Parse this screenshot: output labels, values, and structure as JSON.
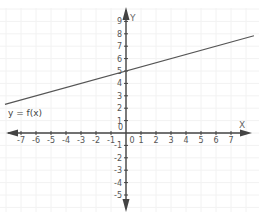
{
  "chart_data": {
    "type": "line",
    "title": "",
    "xlabel": "X",
    "ylabel": "Y",
    "function_label": "y = f(x)",
    "xlim": [
      -8,
      8.5
    ],
    "ylim": [
      -6,
      10
    ],
    "grid": true,
    "x_ticks": [
      -7,
      -6,
      -5,
      -4,
      -3,
      -2,
      -1,
      0,
      1,
      2,
      3,
      4,
      5,
      6,
      7
    ],
    "y_ticks": [
      -5,
      -4,
      -3,
      -2,
      -1,
      0,
      1,
      2,
      3,
      4,
      5,
      6,
      7,
      8,
      9
    ],
    "series": [
      {
        "name": "y = f(x)",
        "equation": "f(x) = x/3 + 5",
        "slope": 0.333,
        "intercept": 5,
        "x": [
          -8,
          -6,
          -3,
          0,
          3,
          6,
          8.5
        ],
        "y": [
          2.33,
          3,
          4,
          5,
          6,
          7,
          7.83
        ]
      }
    ]
  },
  "colors": {
    "axis": "#444444",
    "line": "#555555",
    "grid": "#f2f2f2",
    "text": "#555555"
  }
}
